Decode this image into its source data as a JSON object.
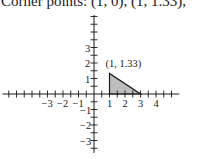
{
  "caption": "Corner points: (1, 0), (1, 1.33),",
  "chart_data": {
    "type": "area",
    "title": "Corner points: (1, 0), (1, 1.33),",
    "xlabel": "",
    "ylabel": "",
    "xlim": [
      -5.9,
      5.5
    ],
    "ylim": [
      -3.8,
      5.1
    ],
    "grid": false,
    "x_tick_labels": [
      "-3",
      "-2",
      "-1",
      "1",
      "2",
      "3",
      "4"
    ],
    "y_tick_labels": [
      "3",
      "2",
      "1",
      "-1",
      "-2",
      "-3"
    ],
    "tick_step": 0.5,
    "region": {
      "name": "feasible region",
      "vertices": [
        [
          1,
          0
        ],
        [
          1,
          1.33
        ],
        [
          3,
          0
        ]
      ],
      "fill": "#bdbdbd"
    },
    "annotations": [
      {
        "text": "(1, 1.33)",
        "x": 1,
        "y": 1.33
      }
    ]
  },
  "style": {
    "axis_color": "#1a1a1a",
    "fill_color": "#bdbdbd"
  }
}
